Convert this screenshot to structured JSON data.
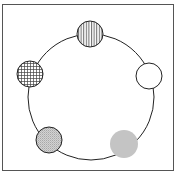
{
  "diagram": {
    "frame": {
      "x": 2.5,
      "y": 4.5,
      "width": 171,
      "height": 166,
      "stroke": "#555555"
    },
    "ring": {
      "cx": 91,
      "cy": 97,
      "r": 63,
      "stroke": "#222222"
    },
    "nodes": [
      {
        "id": "top",
        "pattern": "vertical-stripes",
        "cx": 90,
        "cy": 34,
        "r": 13,
        "fill": "#ffffff",
        "stroke": "#222222"
      },
      {
        "id": "right",
        "pattern": "none",
        "cx": 149,
        "cy": 76,
        "r": 13,
        "fill": "#ffffff",
        "stroke": "#222222"
      },
      {
        "id": "left",
        "pattern": "grid",
        "cx": 30,
        "cy": 74,
        "r": 13,
        "fill": "#ffffff",
        "stroke": "#222222"
      },
      {
        "id": "bottom-left",
        "pattern": "fine-dots",
        "cx": 49,
        "cy": 140,
        "r": 13,
        "fill": "#c8c8c8",
        "stroke": "#222222"
      },
      {
        "id": "bottom-right",
        "pattern": "solid",
        "cx": 124,
        "cy": 144,
        "r": 14,
        "fill": "#c4c4c4",
        "stroke": "none"
      }
    ]
  }
}
